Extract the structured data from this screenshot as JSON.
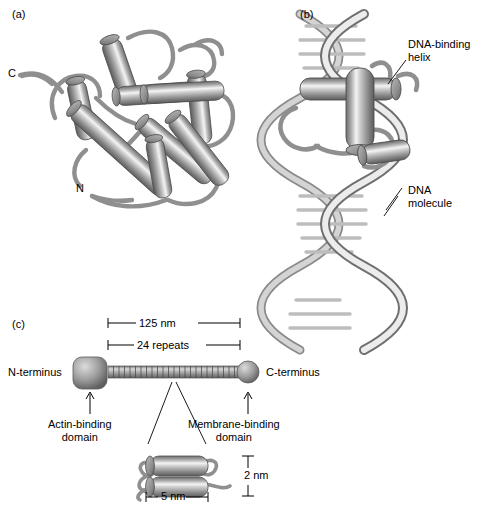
{
  "figure": {
    "type": "scientific-illustration"
  },
  "panels": {
    "a": {
      "label": "(a)",
      "name": "helical-bundle-protein",
      "annotations": {
        "c_terminus": "C",
        "n_terminus": "N"
      }
    },
    "b": {
      "label": "(b)",
      "name": "dna-binding-protein-on-dna",
      "annotations": {
        "binding_helix": "DNA-binding\nhelix",
        "dna": "DNA\nmolecule"
      }
    },
    "c": {
      "label": "(c)",
      "name": "spectrin-molecule",
      "annotations": {
        "length": "125 nm",
        "repeats": "24 repeats",
        "n_terminus": "N-terminus",
        "c_terminus": "C-terminus",
        "actin_domain": "Actin-binding\ndomain",
        "membrane_domain": "Membrane-binding\ndomain",
        "inset_width": "5 nm",
        "inset_height": "2 nm"
      },
      "repeat_count": 24
    }
  },
  "colors": {
    "ink": "#000000",
    "helix_light": "#f2f2f2",
    "helix_mid": "#9a9a9a",
    "helix_dark": "#5f5f5f",
    "loop": "#8c8c8c",
    "dna_light": "#e8e8e8",
    "dna_mid": "#b4b4b4",
    "dna_dark": "#777777"
  }
}
